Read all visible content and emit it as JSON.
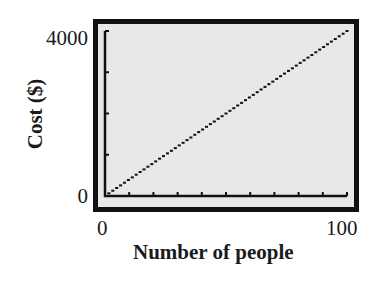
{
  "chart_data": {
    "type": "line",
    "title": "",
    "xlabel": "Number of people",
    "ylabel": "Cost ($)",
    "x": [
      0,
      10,
      20,
      30,
      40,
      50,
      60,
      70,
      80,
      90,
      100
    ],
    "series": [
      {
        "name": "Cost",
        "values": [
          0,
          400,
          800,
          1200,
          1600,
          2000,
          2400,
          2800,
          3200,
          3600,
          4000
        ]
      }
    ],
    "xlim": [
      0,
      100
    ],
    "ylim": [
      0,
      4000
    ],
    "x_tick_labels": [
      "0",
      "100"
    ],
    "y_tick_labels": [
      "0",
      "4000"
    ],
    "x_tick_interval": 10,
    "y_tick_interval": 1000,
    "grid": false,
    "legend": null,
    "style": "graphing-calculator-screen, dotted line",
    "colors": {
      "frame": "#111111",
      "screen_background": "#e8e8e8",
      "line": "#111111"
    }
  },
  "axes": {
    "x_min_label": "0",
    "x_max_label": "100",
    "y_min_label": "0",
    "y_max_label": "4000",
    "x_title": "Number of people",
    "y_title": "Cost ($)"
  }
}
